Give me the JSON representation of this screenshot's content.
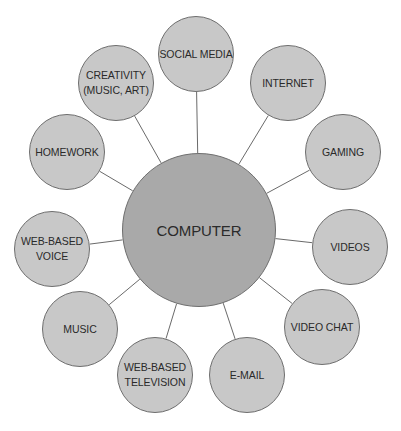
{
  "diagram": {
    "center": {
      "label": "COMPUTER",
      "x": 199,
      "y": 230,
      "r": 77
    },
    "nodes": [
      {
        "id": "social-media",
        "label": "SOCIAL MEDIA",
        "x": 196,
        "y": 54,
        "r": 38
      },
      {
        "id": "internet",
        "label": "INTERNET",
        "x": 288,
        "y": 83,
        "r": 38
      },
      {
        "id": "gaming",
        "label": "GAMING",
        "x": 343,
        "y": 152,
        "r": 38
      },
      {
        "id": "videos",
        "label": "VIDEOS",
        "x": 350,
        "y": 247,
        "r": 38
      },
      {
        "id": "video-chat",
        "label": "VIDEO CHAT",
        "x": 322,
        "y": 327,
        "r": 38
      },
      {
        "id": "e-mail",
        "label": "E-MAIL",
        "x": 247,
        "y": 375,
        "r": 38
      },
      {
        "id": "web-based-television",
        "label": "WEB-BASED\nTELEVISION",
        "x": 155,
        "y": 375,
        "r": 38
      },
      {
        "id": "music",
        "label": "MUSIC",
        "x": 80,
        "y": 329,
        "r": 38
      },
      {
        "id": "web-based-voice",
        "label": "WEB-BASED\nVOICE",
        "x": 52,
        "y": 249,
        "r": 38
      },
      {
        "id": "homework",
        "label": "HOMEWORK",
        "x": 67,
        "y": 152,
        "r": 38
      },
      {
        "id": "creativity",
        "label": "CREATIVITY\n(MUSIC, ART)",
        "x": 116,
        "y": 83,
        "r": 38
      }
    ]
  },
  "colors": {
    "center_fill": "#a9a9a9",
    "node_fill": "#c8c8c8",
    "stroke": "#6e6e6e",
    "text": "#2a2a2a",
    "background": "#ffffff"
  }
}
